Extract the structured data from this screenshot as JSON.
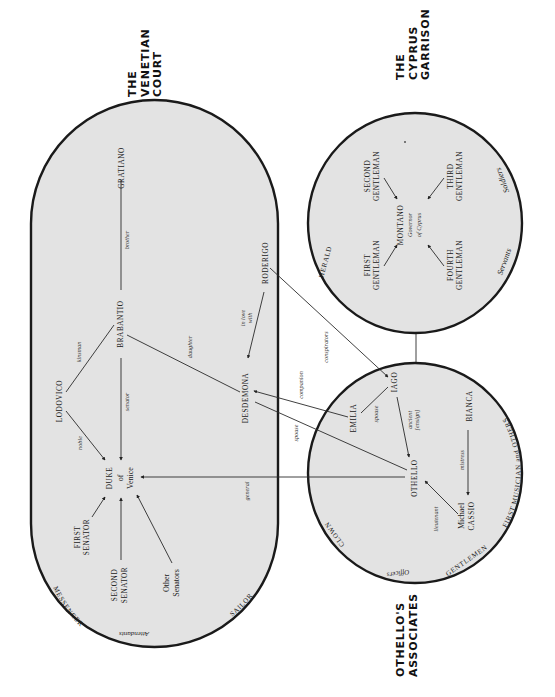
{
  "colors": {
    "region_fill": "#e3e3e3",
    "outline": "#1a1a1a",
    "background": "#ffffff"
  },
  "titles": {
    "venetian": [
      "THE",
      "VENETIAN",
      "COURT"
    ],
    "cyprus": [
      "THE",
      "CYPRUS",
      "GARRISON"
    ],
    "associates": [
      "OTHELLO'S",
      "ASSOCIATES"
    ]
  },
  "venetian_court": {
    "gratiano": "GRATIANO",
    "brabantio": "BRABANTIO",
    "lodovico": "LODOVICO",
    "duke": [
      "DUKE",
      "of",
      "Venice"
    ],
    "first_senator": [
      "FIRST",
      "SENATOR"
    ],
    "second_senator": [
      "SECOND",
      "SENATOR"
    ],
    "other_senators": [
      "Other",
      "Senators"
    ],
    "desdemona": "DESDEMONA",
    "roderigo": "RODERIGO",
    "messenger": "MESSENGER",
    "attendants": "Attendants",
    "sailor": "SAILOR",
    "relations": {
      "brother": "brother",
      "kinsman": "kinsman",
      "noble": "noble",
      "senator": "senator",
      "daughter": "daughter",
      "in_love_with": [
        "in love",
        "with"
      ],
      "general": "general"
    }
  },
  "cyprus_garrison": {
    "montano": "MONTANO",
    "governor": [
      "Governor",
      "of Cyprus"
    ],
    "first_gentleman": [
      "FIRST",
      "GENTLEMAN"
    ],
    "second_gentleman": [
      "SECOND",
      "GENTLEMAN"
    ],
    "third_gentleman": [
      "THIRD",
      "GENTLEMAN"
    ],
    "fourth_gentleman": [
      "FOURTH",
      "GENTLEMAN"
    ],
    "herald": "HERALD",
    "soldiers": "Soldiers",
    "servants": "Servants"
  },
  "othellos_associates": {
    "iago": "IAGO",
    "emilia": "EMILIA",
    "othello": "OTHELLO",
    "bianca": "BIANCA",
    "cassio": [
      "Michael",
      "CASSIO"
    ],
    "clown": "CLOWN",
    "officers": "Officers",
    "gentlemen": "GENTLEMEN",
    "first_musician": "FIRST MUSICIAN and OTHERS",
    "relations": {
      "spouse_iago_emilia": "spouse",
      "ancient": [
        "ancient",
        "[ensign]"
      ],
      "mistress": "mistress",
      "lieutenant": "lieutenant"
    }
  },
  "cross_relations": {
    "conspirators": "conspirators",
    "companion": "companion",
    "spouse": "spouse"
  }
}
